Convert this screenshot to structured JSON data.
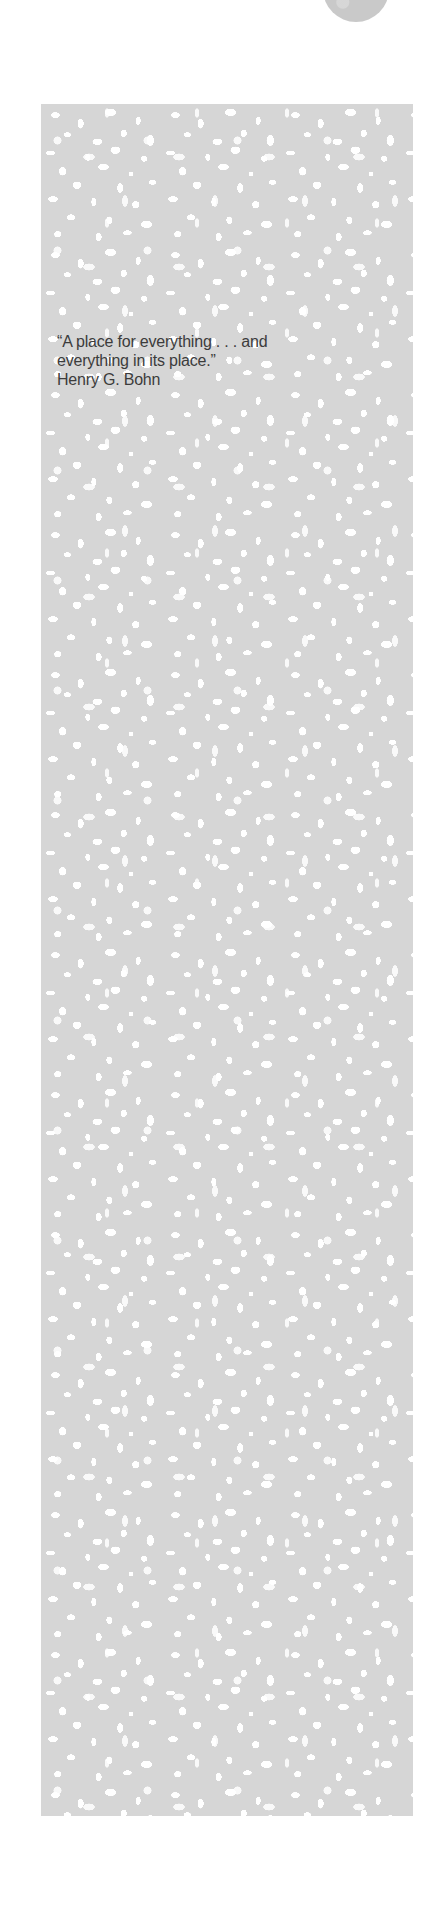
{
  "quote": {
    "lines": [
      "“A place for everything . . . and",
      "everything in its place.”"
    ],
    "author": "Henry G. Bohn"
  },
  "colors": {
    "panel_gray": "#d6d6d6",
    "circle_gray": "#c9c9c9",
    "text": "#3c3c3c",
    "background": "#ffffff"
  }
}
